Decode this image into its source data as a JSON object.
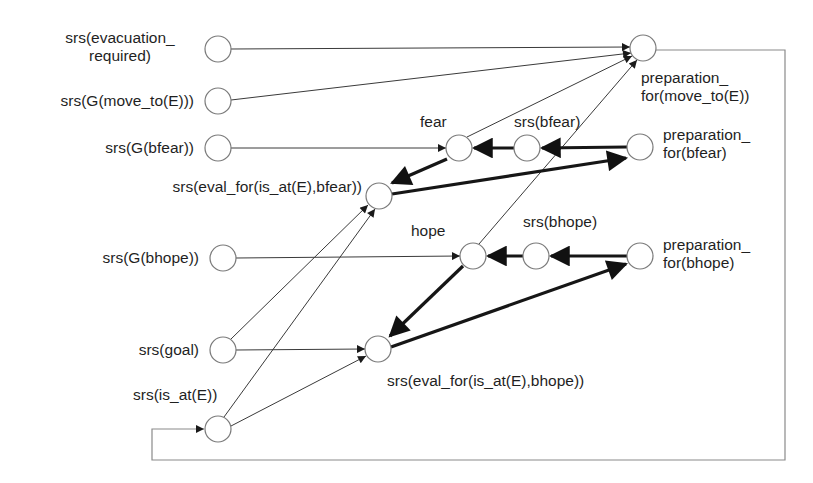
{
  "diagram": {
    "type": "causal-network",
    "nodes": [
      {
        "id": "evac",
        "label_line1": "srs(evacuation_",
        "label_line2": "required)",
        "x": 218,
        "y": 49
      },
      {
        "id": "gmove",
        "label": "srs(G(move_to(E)))",
        "x": 218,
        "y": 101
      },
      {
        "id": "gbfear",
        "label": "srs(G(bfear))",
        "x": 218,
        "y": 148
      },
      {
        "id": "evalfear",
        "label": "srs(eval_for(is_at(E),bfear))",
        "x": 379,
        "y": 196
      },
      {
        "id": "gbhope",
        "label": "srs(G(bhope))",
        "x": 223,
        "y": 258
      },
      {
        "id": "goal",
        "label": "srs(goal)",
        "x": 223,
        "y": 350
      },
      {
        "id": "isat",
        "label": "srs(is_at(E))",
        "x": 218,
        "y": 429
      },
      {
        "id": "fear",
        "label": "fear",
        "x": 459,
        "y": 148
      },
      {
        "id": "sbfear",
        "label": "srs(bfear)",
        "x": 527,
        "y": 148
      },
      {
        "id": "prepfear",
        "label_line1": "preparation_",
        "label_line2": "for(bfear)",
        "x": 640,
        "y": 147
      },
      {
        "id": "hope",
        "label": "hope",
        "x": 473,
        "y": 256
      },
      {
        "id": "sbhope",
        "label": "srs(bhope)",
        "x": 536,
        "y": 256
      },
      {
        "id": "prephope",
        "label_line1": "preparation_",
        "label_line2": "for(bhope)",
        "x": 640,
        "y": 256
      },
      {
        "id": "evalhope",
        "label": "srs(eval_for(is_at(E),bhope))",
        "x": 378,
        "y": 349
      },
      {
        "id": "prepmove",
        "label_line1": "preparation_",
        "label_line2": "for(move_to(E))",
        "x": 643,
        "y": 48
      }
    ],
    "edges": [
      {
        "from": "evac",
        "to": "prepmove",
        "weight": "thin"
      },
      {
        "from": "gmove",
        "to": "prepmove",
        "weight": "thin"
      },
      {
        "from": "fear",
        "to": "prepmove",
        "weight": "thin"
      },
      {
        "from": "hope",
        "to": "prepmove",
        "weight": "thin"
      },
      {
        "from": "gbfear",
        "to": "fear",
        "weight": "thin"
      },
      {
        "from": "sbfear",
        "to": "fear",
        "weight": "thick"
      },
      {
        "from": "prepfear",
        "to": "sbfear",
        "weight": "thick"
      },
      {
        "from": "fear",
        "to": "evalfear",
        "weight": "thick"
      },
      {
        "from": "evalfear",
        "to": "prepfear",
        "weight": "thick"
      },
      {
        "from": "goal",
        "to": "evalfear",
        "weight": "thin"
      },
      {
        "from": "isat",
        "to": "evalfear",
        "weight": "thin"
      },
      {
        "from": "gbhope",
        "to": "hope",
        "weight": "thin"
      },
      {
        "from": "sbhope",
        "to": "hope",
        "weight": "thick"
      },
      {
        "from": "prephope",
        "to": "sbhope",
        "weight": "thick"
      },
      {
        "from": "hope",
        "to": "evalhope",
        "weight": "thick"
      },
      {
        "from": "evalhope",
        "to": "prephope",
        "weight": "thick"
      },
      {
        "from": "goal",
        "to": "evalhope",
        "weight": "thin"
      },
      {
        "from": "isat",
        "to": "evalhope",
        "weight": "thin"
      },
      {
        "from": "prepmove",
        "to": "isat",
        "weight": "thin",
        "routing": "feedback-loop"
      }
    ],
    "colors": {
      "line": "#3a3a3a",
      "thick": "#1a1a1a",
      "node_stroke": "#7a7a7a",
      "loop": "#8a8a8a"
    }
  }
}
